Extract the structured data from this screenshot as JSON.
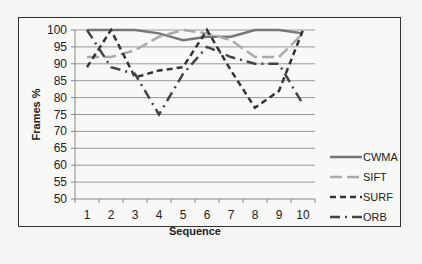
{
  "chart_data": {
    "type": "line",
    "title": "",
    "xlabel": "Sequence",
    "ylabel": "Frames %",
    "x": [
      1,
      2,
      3,
      4,
      5,
      6,
      7,
      8,
      9,
      10
    ],
    "ylim": [
      50,
      100
    ],
    "yticks": [
      50,
      55,
      60,
      65,
      70,
      75,
      80,
      85,
      90,
      95,
      100
    ],
    "grid": true,
    "legend_position": "right",
    "series": [
      {
        "name": "CWMA",
        "style": "solid",
        "color": "#777777",
        "values": [
          100,
          100,
          100,
          99,
          97,
          98,
          98,
          100,
          100,
          99
        ]
      },
      {
        "name": "SIFT",
        "style": "long-dash",
        "color": "#aaaaaa",
        "values": [
          92,
          92,
          94,
          98,
          100,
          99,
          97,
          92,
          92,
          99
        ]
      },
      {
        "name": "SURF",
        "style": "dash",
        "color": "#333333",
        "values": [
          89,
          100,
          86,
          88,
          89,
          100,
          88,
          77,
          82,
          100
        ]
      },
      {
        "name": "ORB",
        "style": "dash-dot",
        "color": "#444444",
        "values": [
          100,
          89,
          87,
          75,
          87,
          95,
          92,
          90,
          90,
          78
        ]
      }
    ]
  }
}
